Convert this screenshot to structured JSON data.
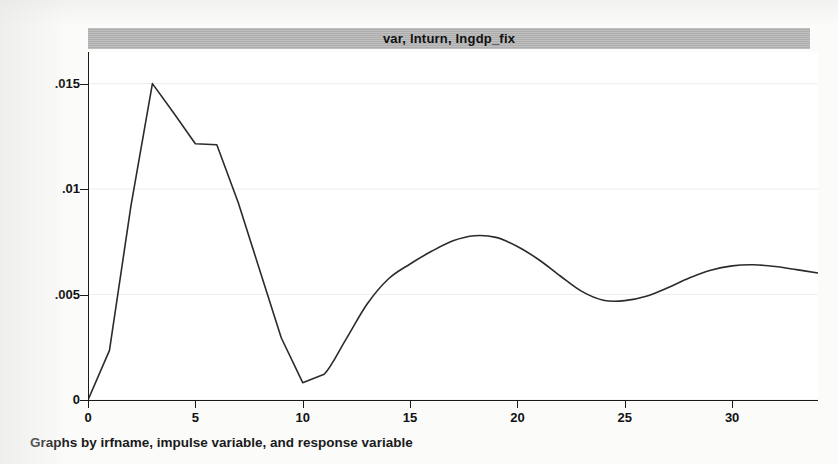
{
  "figure": {
    "title": "var, lnturn, lngdp_fix",
    "caption": "Graphs by irfname, impulse variable, and response variable",
    "line_color": "#2b2b2b",
    "title_bar_color": "#b2b2b2",
    "background_color": "#ffffff"
  },
  "axes": {
    "y_ticks": [
      "0",
      ".005",
      ".01",
      ".015"
    ],
    "x_ticks": [
      "0",
      "5",
      "10",
      "15",
      "20",
      "25",
      "30"
    ]
  },
  "chart_data": {
    "type": "line",
    "title": "var, lnturn, lngdp_fix",
    "subtitle": "",
    "xlabel": "",
    "ylabel": "",
    "caption": "Graphs by irfname, impulse variable, and response variable",
    "xlim": [
      0,
      34
    ],
    "ylim": [
      0,
      0.0165
    ],
    "x_ticks": [
      0,
      5,
      10,
      15,
      20,
      25,
      30
    ],
    "y_ticks": [
      0,
      0.005,
      0.01,
      0.015
    ],
    "grid": true,
    "grid_axis": "y",
    "legend": false,
    "series": [
      {
        "name": "impulse response",
        "x": [
          0,
          1,
          2,
          3,
          4,
          5,
          6,
          7,
          8,
          9,
          10,
          11,
          12,
          13,
          14,
          15,
          16,
          17,
          18,
          19,
          20,
          21,
          22,
          23,
          24,
          25,
          26,
          27,
          28,
          29,
          30,
          31,
          32,
          33,
          34
        ],
        "y": [
          0.0,
          0.00235,
          0.0092,
          0.015,
          0.0136,
          0.01215,
          0.0121,
          0.00935,
          0.00615,
          0.00295,
          0.00082,
          0.00122,
          0.00285,
          0.00455,
          0.00575,
          0.00645,
          0.00705,
          0.00755,
          0.00779,
          0.00771,
          0.00728,
          0.00665,
          0.00588,
          0.00515,
          0.00473,
          0.00471,
          0.00492,
          0.00532,
          0.00578,
          0.00615,
          0.00636,
          0.00641,
          0.00633,
          0.00618,
          0.00602
        ]
      }
    ],
    "annotations": []
  }
}
